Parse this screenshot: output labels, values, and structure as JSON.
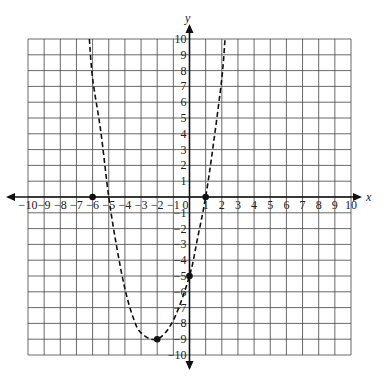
{
  "chart_data": {
    "type": "line",
    "title": "",
    "xlabel": "x",
    "ylabel": "y",
    "xlim": [
      -10,
      10
    ],
    "ylim": [
      -10,
      10
    ],
    "grid": true,
    "x_ticks": [
      "-10",
      "-9",
      "-8",
      "-7",
      "-6",
      "-5",
      "-4",
      "-3",
      "-2",
      "-1",
      "0",
      "1",
      "2",
      "3",
      "4",
      "5",
      "6",
      "7",
      "8",
      "9",
      "10"
    ],
    "y_ticks": [
      "10",
      "9",
      "8",
      "7",
      "6",
      "5",
      "4",
      "3",
      "2",
      "1",
      "-1",
      "-2",
      "-3",
      "-4",
      "-5",
      "-6",
      "-7",
      "-8",
      "-9",
      "-10"
    ],
    "series": [
      {
        "name": "parabola",
        "style": "dashed",
        "curve_points": [
          [
            -6.2,
            10
          ],
          [
            -6,
            7.5
          ],
          [
            -5.5,
            4.2
          ],
          [
            -5,
            0
          ],
          [
            -4.5,
            -3.2
          ],
          [
            -4,
            -5.8
          ],
          [
            -3.5,
            -7.6
          ],
          [
            -3,
            -8.6
          ],
          [
            -2,
            -9
          ],
          [
            -1,
            -7.8
          ],
          [
            0,
            -5
          ],
          [
            0.5,
            -2.6
          ],
          [
            1,
            0
          ],
          [
            1.5,
            3.5
          ],
          [
            2,
            7.5
          ],
          [
            2.2,
            10
          ]
        ],
        "marked_points": [
          [
            -6,
            0
          ],
          [
            1,
            0
          ],
          [
            0,
            -5
          ],
          [
            -2,
            -9
          ]
        ]
      }
    ]
  }
}
